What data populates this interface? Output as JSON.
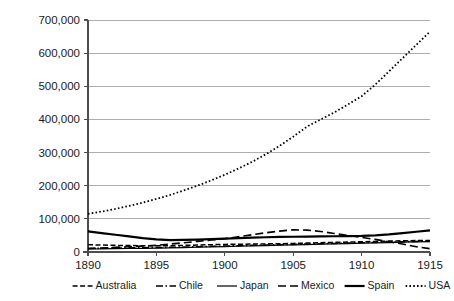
{
  "chart_data": {
    "type": "line",
    "title": "",
    "xlabel": "",
    "ylabel": "",
    "x": [
      1890,
      1891,
      1892,
      1893,
      1894,
      1895,
      1896,
      1897,
      1898,
      1899,
      1900,
      1901,
      1902,
      1903,
      1904,
      1905,
      1906,
      1907,
      1908,
      1909,
      1910,
      1911,
      1912,
      1913,
      1914,
      1915
    ],
    "xlim": [
      1890,
      1915
    ],
    "ylim": [
      0,
      700000
    ],
    "x_ticks": [
      1890,
      1895,
      1900,
      1905,
      1910,
      1915
    ],
    "x_tick_labels": [
      "1890",
      "1895",
      "1900",
      "1905",
      "1910",
      "1915"
    ],
    "y_ticks": [
      0,
      100000,
      200000,
      300000,
      400000,
      500000,
      600000,
      700000
    ],
    "y_tick_labels": [
      "0",
      "100,000",
      "200,000",
      "300,000",
      "400,000",
      "500,000",
      "600,000",
      "700,000"
    ],
    "grid": true,
    "legend_position": "bottom",
    "series": [
      {
        "name": "Australia",
        "style": "short-dash",
        "dasharray": "5,2.5",
        "width": 1.5,
        "values": [
          22000,
          21000,
          20000,
          19500,
          19000,
          18500,
          19000,
          20000,
          21000,
          22000,
          23000,
          23500,
          24000,
          24500,
          25000,
          26000,
          27000,
          28000,
          29000,
          30000,
          31000,
          32000,
          33000,
          34000,
          34500,
          35000
        ]
      },
      {
        "name": "Chile",
        "style": "dash-dot",
        "dasharray": "7,2.5,1.5,2.5",
        "width": 1.5,
        "values": [
          11000,
          11500,
          12000,
          12500,
          13000,
          13500,
          14000,
          15000,
          16000,
          17000,
          18000,
          19000,
          20000,
          21000,
          22000,
          23000,
          24000,
          25000,
          26000,
          27000,
          28000,
          29000,
          30000,
          31000,
          32000,
          33000
        ]
      },
      {
        "name": "Japan",
        "style": "solid",
        "dasharray": "",
        "width": 1.2,
        "values": [
          9000,
          9500,
          10000,
          10500,
          11000,
          11500,
          12500,
          13500,
          14500,
          15500,
          16500,
          17500,
          18500,
          19500,
          20500,
          21500,
          22500,
          23500,
          24500,
          25500,
          26500,
          27500,
          28500,
          29500,
          30500,
          31500
        ]
      },
      {
        "name": "Mexico",
        "style": "dash",
        "dasharray": "8,4",
        "width": 1.6,
        "values": [
          10000,
          12000,
          14000,
          16000,
          18000,
          20000,
          24000,
          28000,
          32000,
          36000,
          40000,
          46000,
          52000,
          58000,
          63000,
          67000,
          66000,
          62000,
          56000,
          50000,
          44000,
          38000,
          31000,
          24000,
          16000,
          10000
        ]
      },
      {
        "name": "Spain",
        "style": "thick-solid",
        "dasharray": "",
        "width": 2.2,
        "values": [
          62000,
          57000,
          52000,
          47000,
          42000,
          38000,
          36000,
          36500,
          37500,
          39000,
          40500,
          42000,
          43500,
          44500,
          45500,
          46000,
          46500,
          47000,
          47500,
          48000,
          48500,
          50000,
          53000,
          57000,
          61000,
          65000
        ]
      },
      {
        "name": "USA",
        "style": "dotted",
        "dasharray": "1.6,2.2",
        "width": 1.8,
        "values": [
          115000,
          122000,
          130000,
          139000,
          149000,
          160000,
          172000,
          186000,
          200000,
          216000,
          233000,
          252000,
          272000,
          295000,
          320000,
          348000,
          378000,
          400000,
          421000,
          445000,
          470000,
          505000,
          545000,
          585000,
          625000,
          665000
        ]
      }
    ]
  }
}
